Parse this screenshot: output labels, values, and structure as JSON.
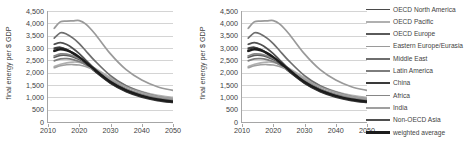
{
  "chart_data": {
    "type": "line",
    "title": "",
    "xlabel": "",
    "ylabel": "final energy per $ GDP",
    "xlim": [
      2010,
      2050
    ],
    "ylim": [
      0,
      4500
    ],
    "xticks": [
      2010,
      2020,
      2030,
      2040,
      2050
    ],
    "ytick_labels": [
      "0",
      "500",
      "1,000",
      "1,500",
      "2,000",
      "2,500",
      "3,000",
      "3,500",
      "4,000",
      "4,500"
    ],
    "yticks": [
      0,
      500,
      1000,
      1500,
      2000,
      2500,
      3000,
      3500,
      4000,
      4500
    ],
    "grid": true,
    "legend_position": "right",
    "panels": [
      "left",
      "right"
    ],
    "x": [
      2012,
      2014,
      2016,
      2018,
      2020,
      2022,
      2025,
      2030,
      2035,
      2040,
      2045,
      2050
    ],
    "series": [
      {
        "name": "OECD North America",
        "color": "#4a4a4a",
        "width": 1.7,
        "values": [
          3000,
          3030,
          2930,
          2780,
          2600,
          2380,
          2050,
          1580,
          1250,
          1040,
          900,
          820
        ]
      },
      {
        "name": "OECD Pacific",
        "color": "#b0b0b0",
        "width": 1.7,
        "values": [
          2250,
          2340,
          2400,
          2430,
          2420,
          2350,
          2180,
          1800,
          1470,
          1230,
          1080,
          1000
        ]
      },
      {
        "name": "OECD Europe",
        "color": "#5a5a5a",
        "width": 1.7,
        "values": [
          2620,
          2700,
          2700,
          2640,
          2530,
          2380,
          2120,
          1680,
          1340,
          1110,
          960,
          870
        ]
      },
      {
        "name": "Eastern Europe/Eurasia",
        "color": "#9a9a9a",
        "width": 1.7,
        "values": [
          3800,
          4060,
          4090,
          4100,
          4110,
          3980,
          3580,
          2760,
          2120,
          1700,
          1430,
          1280
        ]
      },
      {
        "name": "Middle East",
        "color": "#6e6e6e",
        "width": 1.7,
        "values": [
          3400,
          3620,
          3560,
          3400,
          3180,
          2900,
          2480,
          1880,
          1470,
          1210,
          1030,
          930
        ]
      },
      {
        "name": "Latin America",
        "color": "#7d7d7d",
        "width": 1.7,
        "values": [
          2480,
          2560,
          2570,
          2530,
          2450,
          2320,
          2080,
          1640,
          1310,
          1090,
          950,
          860
        ]
      },
      {
        "name": "China",
        "color": "#3a3a3a",
        "width": 1.7,
        "values": [
          2960,
          3010,
          2940,
          2800,
          2620,
          2400,
          2060,
          1570,
          1230,
          1010,
          870,
          790
        ]
      },
      {
        "name": "Africa",
        "color": "#868686",
        "width": 1.7,
        "values": [
          2680,
          2760,
          2750,
          2680,
          2570,
          2420,
          2150,
          1690,
          1340,
          1110,
          960,
          870
        ]
      },
      {
        "name": "India",
        "color": "#9f9f9f",
        "width": 1.7,
        "values": [
          2200,
          2280,
          2320,
          2330,
          2310,
          2250,
          2090,
          1740,
          1420,
          1190,
          1030,
          940
        ]
      },
      {
        "name": "Non-OECD Asia",
        "color": "#4f4f4f",
        "width": 1.7,
        "values": [
          3150,
          3220,
          3140,
          2980,
          2770,
          2520,
          2150,
          1630,
          1280,
          1050,
          900,
          810
        ]
      },
      {
        "name": "weighted average",
        "color": "#1c1c1c",
        "width": 2.4,
        "values": [
          2880,
          2950,
          2900,
          2790,
          2630,
          2430,
          2110,
          1620,
          1280,
          1060,
          910,
          830
        ]
      }
    ]
  },
  "legend": {
    "items": [
      {
        "label": "OECD North America"
      },
      {
        "label": "OECD Pacific"
      },
      {
        "label": "OECD Europe"
      },
      {
        "label": "Eastern Europe/Eurasia"
      },
      {
        "label": "Middle East"
      },
      {
        "label": "Latin America"
      },
      {
        "label": "China"
      },
      {
        "label": "Africa"
      },
      {
        "label": "India"
      },
      {
        "label": "Non-OECD Asia"
      },
      {
        "label": "weighted average"
      }
    ]
  }
}
